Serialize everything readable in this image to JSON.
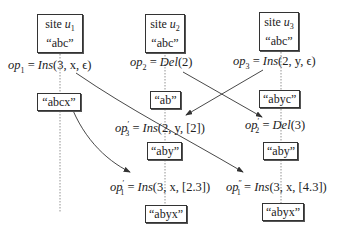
{
  "sites": [
    {
      "id": "u1",
      "title": "site",
      "name": "u",
      "sub": "1",
      "initial": "“abc”"
    },
    {
      "id": "u2",
      "title": "site",
      "name": "u",
      "sub": "2",
      "initial": "“abc”"
    },
    {
      "id": "u3",
      "title": "site",
      "name": "u",
      "sub": "3",
      "initial": "“abc”"
    }
  ],
  "ops": {
    "op1": {
      "name": "op",
      "sub": "1",
      "prime": "",
      "func": "Ins",
      "args": "(3, x, ϵ)"
    },
    "op2": {
      "name": "op",
      "sub": "2",
      "prime": "",
      "func": "Del",
      "args": "(2)"
    },
    "op3": {
      "name": "op",
      "sub": "3",
      "prime": "",
      "func": "Ins",
      "args": "(2, y, ϵ)"
    },
    "op3p": {
      "name": "op",
      "sub": "3",
      "prime": "′",
      "func": "Ins",
      "args": "(2, y, [2])"
    },
    "op2p": {
      "name": "op",
      "sub": "2",
      "prime": "′",
      "func": "Del",
      "args": "(3)"
    },
    "op1p": {
      "name": "op",
      "sub": "1",
      "prime": "′",
      "func": "Ins",
      "args": "(3, x, [2.3])"
    },
    "op1pp": {
      "name": "op",
      "sub": "1",
      "prime": "″",
      "func": "Ins",
      "args": "(3, x, [4.3])"
    }
  },
  "states": {
    "u1_after_op1": "“abcx”",
    "u2_after_op2": "“ab”",
    "u3_after_op3": "“abyc”",
    "u2_after_op3p": "“aby”",
    "u3_after_op2p": "“aby”",
    "u2_after_op1p": "“abyx”",
    "u3_after_op1pp": "“abyx”"
  },
  "eq": "="
}
